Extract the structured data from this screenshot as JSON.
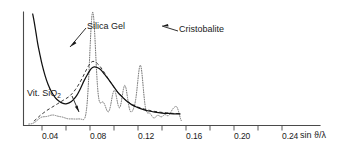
{
  "chart_data": {
    "type": "line",
    "title": "",
    "xlabel": "sin ϑ/λ",
    "ylabel": "",
    "xlim": [
      0.018,
      0.272
    ],
    "ylim": [
      0,
      1
    ],
    "grid": false,
    "legend_position": "inline-annotations",
    "xticks": [
      0.04,
      0.08,
      0.12,
      0.16,
      0.2,
      0.24
    ],
    "xtick_labels": [
      "0.04",
      "0.08",
      "0.12",
      "0.16",
      "0.20",
      "0.24"
    ],
    "annotations": [
      {
        "text": "Silica Gel",
        "target": "solid-curve"
      },
      {
        "text": "Cristobalite",
        "target": "dotted-curve"
      },
      {
        "text": "Vit. SiO",
        "sub": "2",
        "target": "dashed-curve"
      }
    ],
    "series": [
      {
        "name": "Silica Gel",
        "style": "solid",
        "color": "#111111",
        "x": [
          0.0245,
          0.027,
          0.03,
          0.033,
          0.036,
          0.04,
          0.045,
          0.05,
          0.056,
          0.062,
          0.068,
          0.074,
          0.08,
          0.086,
          0.092,
          0.098,
          0.104,
          0.11,
          0.116,
          0.122,
          0.127,
          0.132,
          0.138,
          0.144,
          0.15,
          0.158,
          0.166,
          0.174,
          0.182,
          0.19,
          0.198,
          0.208,
          0.218,
          0.228,
          0.24,
          0.252,
          0.262,
          0.27
        ],
        "y": [
          1.0,
          0.93,
          0.83,
          0.73,
          0.65,
          0.55,
          0.45,
          0.37,
          0.3,
          0.25,
          0.22,
          0.2,
          0.195,
          0.205,
          0.23,
          0.27,
          0.33,
          0.4,
          0.46,
          0.51,
          0.525,
          0.52,
          0.5,
          0.46,
          0.42,
          0.36,
          0.3,
          0.255,
          0.215,
          0.185,
          0.165,
          0.145,
          0.13,
          0.12,
          0.112,
          0.108,
          0.105,
          0.104
        ]
      },
      {
        "name": "Vit. SiO2",
        "style": "dashed",
        "color": "#2a2a2a",
        "x": [
          0.0265,
          0.03,
          0.034,
          0.038,
          0.043,
          0.048,
          0.054,
          0.06,
          0.066,
          0.072,
          0.078,
          0.084,
          0.09,
          0.096,
          0.102,
          0.108,
          0.114,
          0.12,
          0.125,
          0.13,
          0.136,
          0.142,
          0.148,
          0.156,
          0.164,
          0.172,
          0.18,
          0.19,
          0.2,
          0.212,
          0.224,
          0.236,
          0.248,
          0.26,
          0.27
        ],
        "y": [
          0.04,
          0.055,
          0.075,
          0.095,
          0.115,
          0.135,
          0.155,
          0.175,
          0.195,
          0.215,
          0.235,
          0.255,
          0.285,
          0.325,
          0.375,
          0.435,
          0.5,
          0.555,
          0.575,
          0.565,
          0.535,
          0.49,
          0.44,
          0.375,
          0.315,
          0.265,
          0.225,
          0.19,
          0.165,
          0.145,
          0.13,
          0.12,
          0.113,
          0.108,
          0.106
        ]
      },
      {
        "name": "Cristobalite",
        "style": "dotted",
        "color": "#6b6b6b",
        "peaks": [
          {
            "x": 0.0395,
            "height": 0.055,
            "width": 0.0075
          },
          {
            "x": 0.0575,
            "height": 0.075,
            "width": 0.0085
          },
          {
            "x": 0.0745,
            "height": 0.05,
            "width": 0.0075
          },
          {
            "x": 0.0905,
            "height": 0.038,
            "width": 0.007
          },
          {
            "x": 0.1045,
            "height": 0.04,
            "width": 0.0065
          },
          {
            "x": 0.1245,
            "height": 1.0,
            "width": 0.005
          },
          {
            "x": 0.1415,
            "height": 0.195,
            "width": 0.006
          },
          {
            "x": 0.1605,
            "height": 0.3,
            "width": 0.0052
          },
          {
            "x": 0.178,
            "height": 0.345,
            "width": 0.005
          },
          {
            "x": 0.193,
            "height": 0.105,
            "width": 0.0048
          },
          {
            "x": 0.204,
            "height": 0.52,
            "width": 0.0048
          },
          {
            "x": 0.219,
            "height": 0.095,
            "width": 0.0048
          },
          {
            "x": 0.233,
            "height": 0.075,
            "width": 0.0046
          },
          {
            "x": 0.245,
            "height": 0.08,
            "width": 0.0046
          },
          {
            "x": 0.257,
            "height": 0.105,
            "width": 0.0045
          },
          {
            "x": 0.265,
            "height": 0.13,
            "width": 0.0042
          }
        ],
        "baseline": 0.012
      }
    ]
  },
  "axis": {
    "x_title": "sin ϑ/λ",
    "tick_labels": [
      "0.04",
      "0.08",
      "0.12",
      "0.16",
      "0.20",
      "0.24"
    ]
  },
  "labels": {
    "silica_gel": "Silica Gel",
    "cristobalite": "Cristobalite",
    "vit_sio2_text": "Vit. SiO",
    "vit_sio2_sub": "2"
  }
}
